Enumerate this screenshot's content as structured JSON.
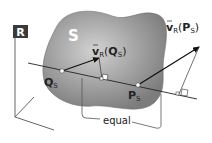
{
  "diagram": {
    "frame_label": "R",
    "body_label": "S",
    "point_q": {
      "base": "Q",
      "sub": "S"
    },
    "point_p": {
      "base": "P",
      "sub": "S"
    },
    "vector_q": {
      "v": "v",
      "sub": "R",
      "arg": "Q",
      "argsub": "S"
    },
    "vector_p": {
      "v": "v",
      "sub": "R",
      "arg": "P",
      "argsub": "S"
    },
    "bracket_label": "equal",
    "colors": {
      "body_fill": "#8a8a8a",
      "body_highlight": "#c8c8c8",
      "frame_box": "#3a3a3a",
      "line": "#222222"
    }
  }
}
